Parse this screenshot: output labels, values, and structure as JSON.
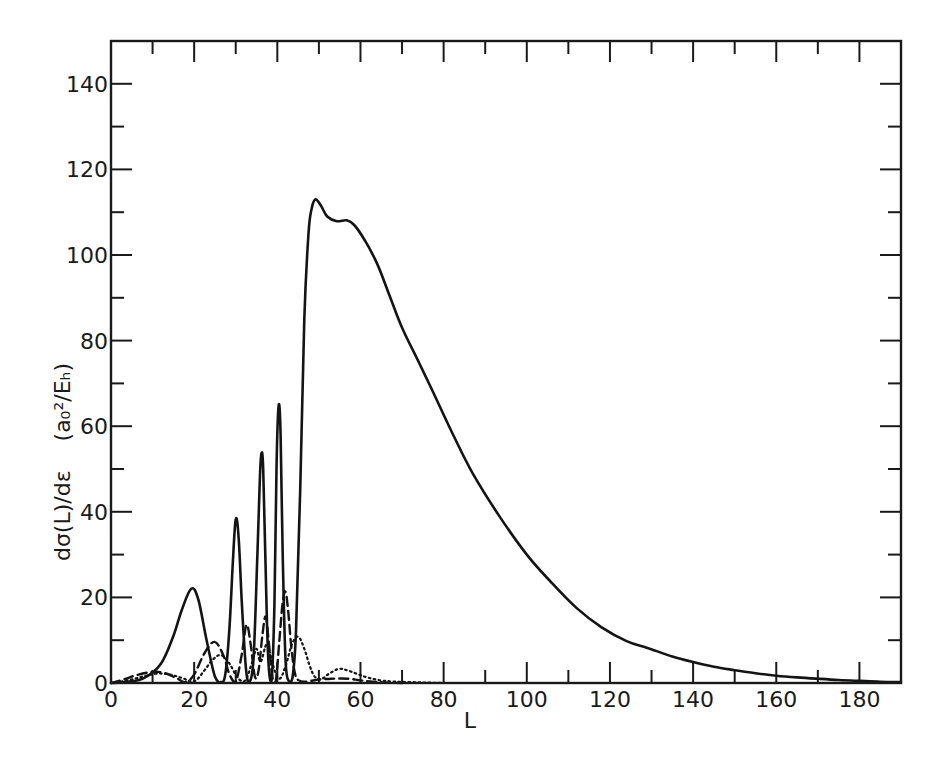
{
  "chart_data": {
    "type": "line",
    "title": "",
    "xlabel": "L",
    "ylabel": "dσ(L)/dε   (a₀²/Eₕ)",
    "ylabel_parts": {
      "quantity": "dσ(L)/dε",
      "units": "(a₀²/Eₕ)"
    },
    "xlim": [
      0,
      190
    ],
    "ylim": [
      0,
      150
    ],
    "x_ticks": [
      0,
      20,
      40,
      60,
      80,
      100,
      120,
      140,
      160,
      180
    ],
    "x_tick_labels": [
      "0",
      "20",
      "40",
      "60",
      "80",
      "100",
      "120",
      "140",
      "160",
      "180"
    ],
    "x_minor_ticks": [
      10,
      30,
      50,
      70,
      90,
      110,
      130,
      150,
      170
    ],
    "y_ticks": [
      0,
      20,
      40,
      60,
      80,
      100,
      120,
      140
    ],
    "y_tick_labels": [
      "0",
      "20",
      "40",
      "60",
      "80",
      "100",
      "120",
      "140"
    ],
    "y_minor_ticks": [
      10,
      30,
      50,
      70,
      90,
      110,
      130
    ],
    "grid": false,
    "legend": null,
    "frame": "box with inward ticks on all sides",
    "series": [
      {
        "name": "solid",
        "style": "solid",
        "x": [
          0,
          4,
          8,
          12,
          15,
          17,
          19.3,
          21,
          23,
          25,
          26.5,
          27.5,
          28.5,
          29.3,
          30,
          30.7,
          31.5,
          32.5,
          33.3,
          34.3,
          35.2,
          35.8,
          36.2,
          36.6,
          37.1,
          37.8,
          38.6,
          39.3,
          39.8,
          40.3,
          40.8,
          41.3,
          42,
          42.8,
          43.6,
          44.5,
          45.5,
          46.5,
          47.5,
          48.3,
          49.2,
          50.5,
          52,
          54.3,
          56.7,
          58.5,
          61,
          64,
          67,
          70,
          74,
          77.2,
          82,
          87,
          93.4,
          100,
          106,
          112,
          118,
          124,
          129,
          135,
          140,
          145,
          150,
          155,
          160,
          165,
          170,
          175,
          180,
          185,
          190
        ],
        "y": [
          0,
          0.3,
          1.2,
          4.5,
          11,
          17,
          22,
          19.5,
          10,
          1.5,
          0.2,
          2,
          13,
          28,
          38.2,
          34,
          18,
          3,
          0.3,
          6,
          30,
          48,
          53.7,
          50,
          30,
          6,
          0.5,
          18,
          50,
          64.7,
          58,
          30,
          5,
          0.4,
          1,
          12,
          45,
          85,
          105,
          111,
          113,
          111.5,
          109,
          107.9,
          108.1,
          107,
          103.5,
          98,
          90.5,
          83,
          75,
          68.5,
          58.6,
          49,
          39,
          30,
          23.4,
          17.5,
          13,
          9.8,
          8.2,
          6.2,
          4.9,
          3.8,
          3,
          2.3,
          1.7,
          1.3,
          1,
          0.7,
          0.5,
          0.3,
          0.2
        ]
      },
      {
        "name": "dashed",
        "style": "dashed",
        "x": [
          0,
          3,
          6,
          10,
          13,
          16,
          18,
          20,
          22.5,
          24.9,
          27,
          28.5,
          30,
          31.5,
          32.6,
          33.6,
          34.6,
          35.5,
          36.4,
          37.2,
          38,
          38.8,
          39.6,
          40.5,
          41.2,
          41.9,
          42.6,
          43.4,
          44.3,
          45.2,
          46.5,
          48,
          50,
          53,
          57,
          60,
          63,
          66,
          70
        ],
        "y": [
          0,
          0.8,
          1.8,
          2.6,
          2.3,
          1,
          0.2,
          2,
          7,
          9.6,
          6.5,
          2,
          0.3,
          7,
          13.6,
          9,
          1.5,
          3,
          11,
          15.5,
          9,
          1.5,
          0.3,
          10,
          18,
          21.4,
          17,
          8,
          2,
          0.6,
          0.3,
          0.5,
          0.8,
          1,
          1,
          0.6,
          0.3,
          0.1,
          0
        ]
      },
      {
        "name": "dotted",
        "style": "dotted",
        "x": [
          0,
          4,
          8,
          11,
          14,
          17,
          20,
          22.5,
          24.5,
          26.5,
          28.5,
          30.5,
          32.3,
          34,
          35,
          36,
          37.5,
          39,
          40.5,
          42,
          43.5,
          45,
          46.5,
          47.8,
          49,
          50.5,
          52.5,
          54.8,
          57,
          59.5,
          62,
          65,
          68,
          72,
          76,
          80
        ],
        "y": [
          0,
          0.6,
          1.6,
          2.2,
          2,
          1.2,
          0.4,
          3,
          5.5,
          6.5,
          4.5,
          1.2,
          0.6,
          5,
          8,
          5,
          9,
          4,
          1,
          4,
          9,
          10.8,
          8,
          4,
          1.5,
          0.9,
          2.2,
          3.3,
          2.9,
          2,
          1.2,
          0.6,
          0.35,
          0.2,
          0.1,
          0
        ]
      }
    ]
  }
}
